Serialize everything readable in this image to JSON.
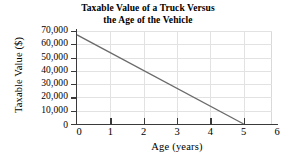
{
  "chart_data": {
    "type": "line",
    "title": "Taxable Value of a Truck Versus the Age of the Vehicle",
    "title_lines": [
      "Taxable Value of a Truck Versus",
      "the Age of the Vehicle"
    ],
    "xlabel": "Age (years)",
    "ylabel": "Taxable Value ($)",
    "xlim": [
      0,
      6
    ],
    "ylim": [
      0,
      70000
    ],
    "xticks": [
      0,
      1,
      2,
      3,
      4,
      5,
      6
    ],
    "xtick_labels": [
      "0",
      "1",
      "2",
      "3",
      "4",
      "5",
      "6"
    ],
    "yticks": [
      0,
      10000,
      20000,
      30000,
      40000,
      50000,
      60000,
      70000
    ],
    "ytick_labels": [
      "0",
      "10,000",
      "20,000",
      "30,000",
      "40,000",
      "50,000",
      "60,000",
      "70,000"
    ],
    "grid": true,
    "legend": null,
    "series": [
      {
        "name": "Taxable Value",
        "x": [
          0,
          5
        ],
        "values": [
          67000,
          0
        ],
        "color": "#6a6a6a",
        "linewidth": 1.4
      }
    ],
    "annotations": []
  },
  "style": {
    "axis_color": "#3a3a3a",
    "grid_color": "#e2e2e2",
    "frame_color": "#d9d9d9",
    "background": "#ffffff",
    "text_color": "#000000"
  }
}
